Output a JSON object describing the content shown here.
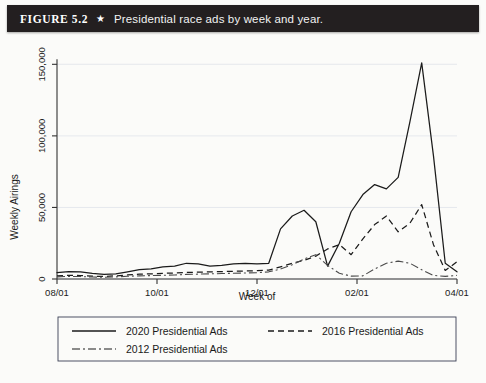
{
  "figure": {
    "number": "FIGURE 5.2",
    "star": "★",
    "caption": "Presidential race ads by week and year."
  },
  "chart_data": {
    "type": "line",
    "title": "Presidential race ads by week and year.",
    "xlabel": "Week of",
    "ylabel": "Weekly Airings",
    "ylim": [
      0,
      160000
    ],
    "yticks": [
      0,
      50000,
      100000,
      150000
    ],
    "ytick_labels": [
      "0",
      "50,000",
      "100,000",
      "150,000"
    ],
    "xlim": [
      0,
      34
    ],
    "xticks": [
      0,
      8.5,
      17,
      25.5,
      34
    ],
    "xtick_labels": [
      "08/01",
      "10/01",
      "12/01",
      "02/01",
      "04/01"
    ],
    "grid": true,
    "legend_position": "below-plot",
    "series": [
      {
        "name": "2020 Presidential Ads",
        "style": "solid",
        "color": "#1b1b1b",
        "x": [
          0,
          1,
          2,
          3,
          4,
          5,
          6,
          7,
          8,
          9,
          10,
          11,
          12,
          13,
          14,
          15,
          16,
          17,
          18,
          19,
          20,
          21,
          22,
          23,
          24,
          25,
          26,
          27,
          28,
          29,
          30,
          31,
          32,
          33,
          34
        ],
        "values": [
          4500,
          5200,
          5000,
          4000,
          3200,
          3600,
          5000,
          6500,
          7000,
          8500,
          9000,
          11000,
          10500,
          9000,
          9500,
          10500,
          11000,
          10500,
          11000,
          35000,
          44000,
          48000,
          40000,
          9000,
          25000,
          47000,
          59000,
          66000,
          63000,
          71000,
          110000,
          151000,
          86000,
          11000,
          5000
        ]
      },
      {
        "name": "2016 Presidential Ads",
        "style": "dashed",
        "color": "#1b1b1b",
        "x": [
          0,
          1,
          2,
          3,
          4,
          5,
          6,
          7,
          8,
          9,
          10,
          11,
          12,
          13,
          14,
          15,
          16,
          17,
          18,
          19,
          20,
          21,
          22,
          23,
          24,
          25,
          26,
          27,
          28,
          29,
          30,
          31,
          32,
          33,
          34
        ],
        "values": [
          2200,
          2600,
          2400,
          2000,
          1800,
          2200,
          2800,
          3400,
          3600,
          4000,
          4200,
          4600,
          4800,
          5000,
          5200,
          5400,
          5600,
          5800,
          6200,
          8500,
          11000,
          13000,
          16000,
          21000,
          24000,
          17000,
          28000,
          38000,
          44000,
          33000,
          39000,
          52000,
          24000,
          6000,
          12000
        ]
      },
      {
        "name": "2012 Presidential Ads",
        "style": "dash-dot",
        "color": "#4a4a4a",
        "x": [
          0,
          1,
          2,
          3,
          4,
          5,
          6,
          7,
          8,
          9,
          10,
          11,
          12,
          13,
          14,
          15,
          16,
          17,
          18,
          19,
          20,
          21,
          22,
          23,
          24,
          25,
          26,
          27,
          28,
          29,
          30,
          31,
          32,
          33,
          34
        ],
        "values": [
          1500,
          1800,
          1700,
          1400,
          1200,
          1500,
          1900,
          2200,
          2400,
          2600,
          2800,
          3200,
          3400,
          3600,
          3800,
          4000,
          4200,
          4400,
          5000,
          7000,
          10000,
          14000,
          17000,
          9500,
          4000,
          2000,
          2200,
          7000,
          11000,
          12500,
          11000,
          6500,
          2500,
          1800,
          2500
        ]
      }
    ]
  },
  "legend": {
    "items": [
      {
        "label": "2020 Presidential Ads",
        "style": "solid"
      },
      {
        "label": "2016 Presidential Ads",
        "style": "dashed"
      },
      {
        "label": "2012 Presidential Ads",
        "style": "dash-dot"
      }
    ]
  }
}
